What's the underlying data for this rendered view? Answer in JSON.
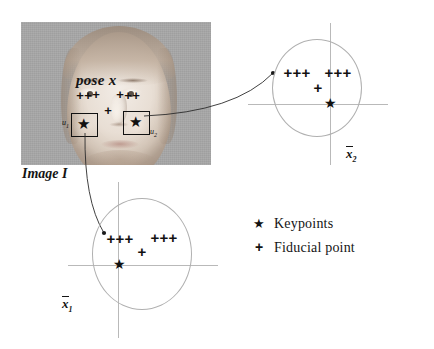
{
  "figure": {
    "caption_labels": {
      "pose": "pose x",
      "image": "Image I"
    },
    "photo": {
      "name": "frontal-face-photograph",
      "background_color": "#a8a8a8",
      "x": 21,
      "y": 22,
      "width": 190,
      "height": 143,
      "fiducial_points": [
        {
          "x": 80,
          "y": 95
        },
        {
          "x": 88,
          "y": 95
        },
        {
          "x": 96,
          "y": 94
        },
        {
          "x": 120,
          "y": 94
        },
        {
          "x": 128,
          "y": 95
        },
        {
          "x": 136,
          "y": 95
        },
        {
          "x": 108,
          "y": 110
        }
      ],
      "keypoints": [
        {
          "label": "u",
          "sub": "1",
          "x": 83,
          "y": 124,
          "box": {
            "x": 71,
            "y": 113,
            "w": 25,
            "h": 22
          },
          "label_x": 62,
          "label_y": 118
        },
        {
          "label": "u",
          "sub": "2",
          "x": 135,
          "y": 122,
          "box": {
            "x": 123,
            "y": 111,
            "w": 25,
            "h": 22
          },
          "label_x": 150,
          "label_y": 127
        }
      ]
    },
    "arrows": [
      {
        "name": "arrow-keypoint2-to-panel2",
        "from": {
          "x": 144,
          "y": 116
        },
        "ctrl": {
          "x": 235,
          "y": 112
        },
        "to": {
          "x": 273,
          "y": 73
        }
      },
      {
        "name": "arrow-keypoint1-to-panel1",
        "from": {
          "x": 85,
          "y": 133
        },
        "ctrl": {
          "x": 84,
          "y": 200
        },
        "to": {
          "x": 104,
          "y": 233
        }
      }
    ],
    "legend": {
      "items": [
        {
          "symbol": "★",
          "label": "Keypoints",
          "kind": "star"
        },
        {
          "symbol": "+",
          "label": "Fiducial point",
          "kind": "plus"
        }
      ]
    }
  },
  "chart_data": [
    {
      "type": "scatter",
      "name": "panel-xbar2",
      "title": "",
      "axis_label": "x̅2",
      "axis_label_base": "x",
      "axis_label_sub": "2",
      "origin": {
        "x": 330,
        "y": 104
      },
      "ellipse": {
        "cx": 316,
        "cy": 87,
        "rx": 44,
        "ry": 48
      },
      "xlabel": "",
      "ylabel": "",
      "grid": false,
      "legend_position": "outside-bottom-right",
      "series": [
        {
          "name": "Fiducial point",
          "marker": "+",
          "points": [
            {
              "x": 288,
              "y": 72
            },
            {
              "x": 297,
              "y": 72
            },
            {
              "x": 306,
              "y": 72
            },
            {
              "x": 329,
              "y": 72
            },
            {
              "x": 338,
              "y": 72
            },
            {
              "x": 347,
              "y": 72
            },
            {
              "x": 318,
              "y": 87
            }
          ]
        },
        {
          "name": "Keypoints",
          "marker": "★",
          "points": [
            {
              "x": 330,
              "y": 104
            }
          ]
        }
      ]
    },
    {
      "type": "scatter",
      "name": "panel-xbar1",
      "title": "",
      "axis_label": "x̅1",
      "axis_label_base": "x",
      "axis_label_sub": "1",
      "origin": {
        "x": 118,
        "y": 265
      },
      "ellipse": {
        "cx": 141,
        "cy": 253,
        "rx": 49,
        "ry": 55
      },
      "xlabel": "",
      "ylabel": "",
      "grid": false,
      "legend_position": "outside-right",
      "series": [
        {
          "name": "Fiducial point",
          "marker": "+",
          "points": [
            {
              "x": 111,
              "y": 238
            },
            {
              "x": 120,
              "y": 238
            },
            {
              "x": 129,
              "y": 238
            },
            {
              "x": 155,
              "y": 237
            },
            {
              "x": 164,
              "y": 237
            },
            {
              "x": 173,
              "y": 237
            },
            {
              "x": 142,
              "y": 251
            }
          ]
        },
        {
          "name": "Keypoints",
          "marker": "★",
          "points": [
            {
              "x": 119,
              "y": 265
            }
          ]
        }
      ]
    }
  ]
}
